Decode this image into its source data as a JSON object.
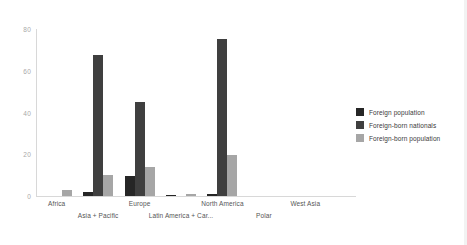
{
  "chart_data": {
    "type": "bar",
    "title": "",
    "xlabel": "",
    "ylabel": "",
    "ylim": [
      0,
      80
    ],
    "yticks": [
      0,
      20,
      40,
      60,
      80
    ],
    "grid": false,
    "legend_position": "right",
    "categories": [
      "Africa",
      "Asia + Pacific",
      "Europe",
      "Latin America + Car...",
      "North America",
      "Polar",
      "West Asia"
    ],
    "series": [
      {
        "name": "Foreign population",
        "color": "#262626",
        "values": [
          0,
          2,
          9.5,
          0.3,
          1,
          0,
          0
        ]
      },
      {
        "name": "Foreign-born nationals",
        "color": "#3f3f3f",
        "values": [
          0,
          67.5,
          45,
          0,
          75,
          0,
          0
        ]
      },
      {
        "name": "Foreign-born population",
        "color": "#a6a6a6",
        "values": [
          3,
          10,
          14,
          1,
          19.5,
          0,
          0
        ]
      }
    ]
  },
  "axis": {
    "y_tick_labels": [
      "0",
      "20",
      "40",
      "60",
      "80"
    ]
  },
  "legend": {
    "items": [
      {
        "label": "Foreign population"
      },
      {
        "label": "Foreign-born nationals"
      },
      {
        "label": "Foreign-born population"
      }
    ]
  }
}
